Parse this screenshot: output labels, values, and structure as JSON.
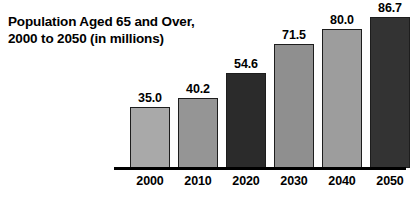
{
  "chart_data": {
    "type": "bar",
    "title": "Population Aged 65 and Over, 2000 to 2050 (in millions)",
    "title_lines": [
      "Population Aged 65 and Over,",
      "2000 to 2050 (in millions)"
    ],
    "categories": [
      "2000",
      "2010",
      "2020",
      "2030",
      "2040",
      "2050"
    ],
    "values": [
      35.0,
      40.2,
      54.6,
      71.5,
      80.0,
      86.7
    ],
    "value_labels": [
      "35.0",
      "40.2",
      "54.6",
      "71.5",
      "80.0",
      "86.7"
    ],
    "bar_colors": [
      "#a9a9a9",
      "#959595",
      "#2b2b2b",
      "#8f8f8f",
      "#9d9d9d",
      "#333333"
    ],
    "bar_border_color": "#1d1d1d",
    "xlabel": "",
    "ylabel": "",
    "ylim": [
      0,
      92
    ],
    "grid": false,
    "legend": false,
    "axis_line_color": "#000000",
    "background": "#ffffff"
  }
}
